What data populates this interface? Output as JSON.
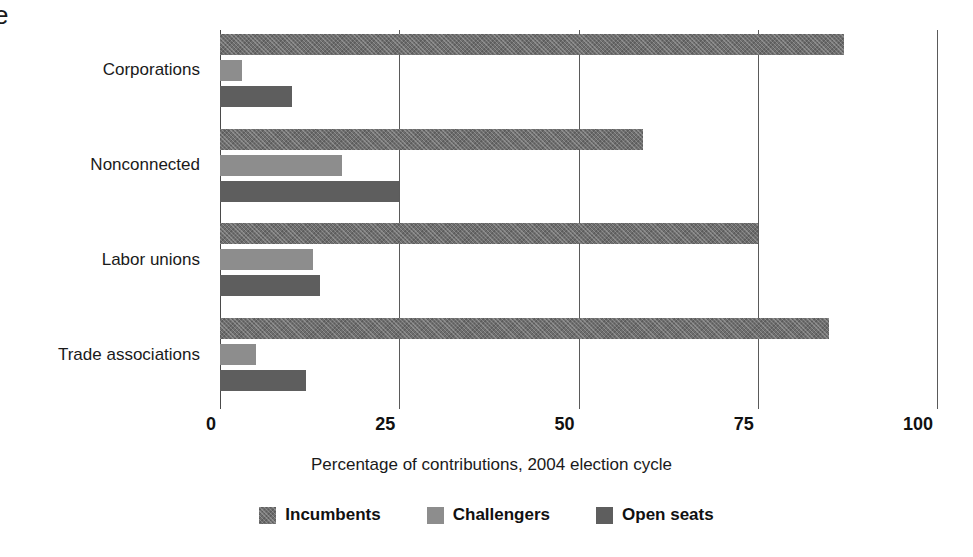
{
  "clipped_text": "e",
  "chart_data": {
    "type": "bar",
    "orientation": "horizontal",
    "title": "",
    "xlabel": "Percentage of contributions, 2004 election cycle",
    "ylabel": "",
    "xlim": [
      0,
      100
    ],
    "xticks": [
      0,
      25,
      50,
      75,
      100
    ],
    "xtick_labels": [
      "0",
      "25",
      "50",
      "75",
      "100"
    ],
    "grid": "vertical",
    "legend_position": "bottom-center",
    "categories": [
      "Corporations",
      "Nonconnected",
      "Labor unions",
      "Trade associations"
    ],
    "series": [
      {
        "name": "Incumbents",
        "color": "#6e6e6e",
        "pattern": "cross-hatch",
        "values": [
          87,
          59,
          75,
          85
        ]
      },
      {
        "name": "Challengers",
        "color": "#8d8d8d",
        "pattern": "solid",
        "values": [
          3,
          17,
          13,
          5
        ]
      },
      {
        "name": "Open seats",
        "color": "#5e5e5e",
        "pattern": "solid",
        "values": [
          10,
          25,
          14,
          12
        ]
      }
    ]
  },
  "legend": {
    "items": [
      {
        "label": "Incumbents"
      },
      {
        "label": "Challengers"
      },
      {
        "label": "Open seats"
      }
    ]
  }
}
